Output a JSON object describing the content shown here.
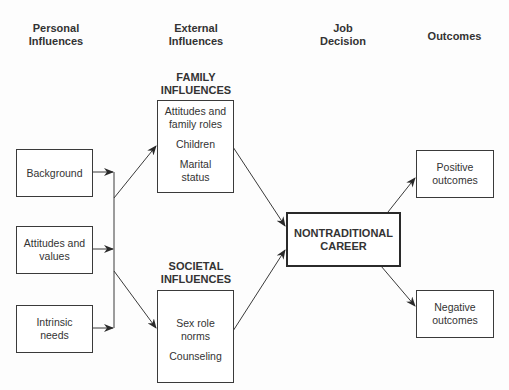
{
  "columns": {
    "personal": "Personal Influences",
    "external": "External Influences",
    "decision": "Job Decision",
    "outcomes": "Outcomes"
  },
  "sections": {
    "family": "FAMILY INFLUENCES",
    "societal": "SOCIETAL INFLUENCES"
  },
  "personal_boxes": [
    {
      "label": "Background"
    },
    {
      "label": "Attitudes and values"
    },
    {
      "label": "Intrinsic needs"
    }
  ],
  "family_box": {
    "items": [
      "Attitudes and family roles",
      "Children",
      "Marital status"
    ]
  },
  "societal_box": {
    "items": [
      "Sex role norms",
      "Counseling"
    ]
  },
  "decision_box": {
    "label": "NONTRADITIONAL CAREER"
  },
  "outcome_boxes": [
    {
      "label": "Positive outcomes"
    },
    {
      "label": "Negative outcomes"
    }
  ],
  "colors": {
    "line": "#3a3a3a",
    "text": "#333333",
    "background": "#fdfdfd"
  }
}
